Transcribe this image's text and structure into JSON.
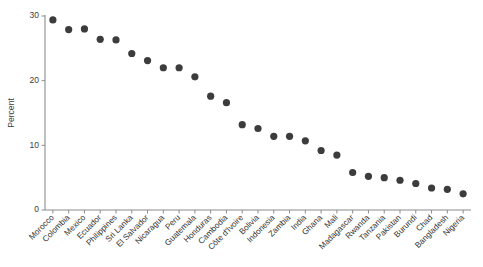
{
  "chart_data": {
    "type": "scatter",
    "title": "",
    "subtitle": "",
    "xlabel": "",
    "ylabel": "Percent",
    "ylim": [
      0,
      30
    ],
    "yticks": [
      0,
      10,
      20,
      30
    ],
    "ytick_labels": [
      "0",
      "10",
      "20",
      "30"
    ],
    "grid": false,
    "legend": false,
    "legend_position": "none",
    "marker": "filled-circle",
    "marker_color": "#3c3c3c",
    "axis_color": "#8c8c8c",
    "xtick_rotation_deg": 45,
    "categories": [
      "Morocco",
      "Colombia",
      "Mexico",
      "Ecuador",
      "Philippines",
      "Sri Lanka",
      "El Salvador",
      "Nicaragua",
      "Peru",
      "Guatemala",
      "Honduras",
      "Cambodia",
      "Côte d'Ivoire",
      "Bolivia",
      "Indonesia",
      "Zambia",
      "India",
      "Ghana",
      "Mali",
      "Madagascar",
      "Rwanda",
      "Tanzania",
      "Pakistan",
      "Burundi",
      "Chad",
      "Bangladesh",
      "Nigeria"
    ],
    "values": [
      29.4,
      27.9,
      28.0,
      26.4,
      26.3,
      24.2,
      23.1,
      22.0,
      22.0,
      20.6,
      17.6,
      16.6,
      13.2,
      12.6,
      11.4,
      11.4,
      10.7,
      9.2,
      8.5,
      5.8,
      5.2,
      5.0,
      4.6,
      4.1,
      3.4,
      3.2,
      2.5
    ],
    "series": [
      {
        "name": "Percent",
        "values": [
          29.4,
          27.9,
          28.0,
          26.4,
          26.3,
          24.2,
          23.1,
          22.0,
          22.0,
          20.6,
          17.6,
          16.6,
          13.2,
          12.6,
          11.4,
          11.4,
          10.7,
          9.2,
          8.5,
          5.8,
          5.2,
          5.0,
          4.6,
          4.1,
          3.4,
          3.2,
          2.5
        ]
      }
    ]
  }
}
